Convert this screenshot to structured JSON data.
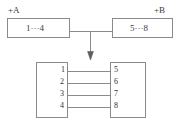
{
  "diagram": {
    "stroke_color": "#8a8a8a",
    "text_color": "#3b3b3b",
    "background": "#ffffff",
    "overview": {
      "left_unit": {
        "tag": "+A",
        "body_label": "1···4"
      },
      "right_unit": {
        "tag": "+B",
        "body_label": "5···8"
      },
      "link_label": ""
    },
    "detail": {
      "arrow": "down-arrow",
      "left_connector": {
        "name": "left-connector-block",
        "pins": [
          "1",
          "2",
          "3",
          "4"
        ]
      },
      "right_connector": {
        "name": "right-connector-block",
        "pins": [
          "5",
          "6",
          "7",
          "8"
        ]
      },
      "wires": [
        {
          "from": "1",
          "to": "5"
        },
        {
          "from": "2",
          "to": "6"
        },
        {
          "from": "3",
          "to": "7"
        },
        {
          "from": "4",
          "to": "8"
        }
      ]
    }
  }
}
